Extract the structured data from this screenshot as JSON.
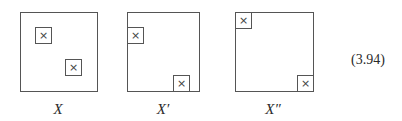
{
  "diagram": {
    "equation_number": "(3.94)",
    "marker_glyph": "×",
    "panels": [
      {
        "label": "X",
        "outer": {
          "x": 20,
          "y": 12,
          "w": 78,
          "h": 80
        },
        "boxes": [
          {
            "x": 35,
            "y": 27
          },
          {
            "x": 65,
            "y": 59
          }
        ],
        "label_pos": {
          "x": 58,
          "y": 102
        }
      },
      {
        "label": "X′",
        "outer": {
          "x": 127,
          "y": 12,
          "w": 73,
          "h": 80
        },
        "boxes": [
          {
            "x": 127,
            "y": 27
          },
          {
            "x": 173,
            "y": 75
          }
        ],
        "label_pos": {
          "x": 163,
          "y": 102
        }
      },
      {
        "label": "X″",
        "outer": {
          "x": 235,
          "y": 12,
          "w": 79,
          "h": 80
        },
        "boxes": [
          {
            "x": 235,
            "y": 12
          },
          {
            "x": 297,
            "y": 75
          }
        ],
        "label_pos": {
          "x": 273,
          "y": 102
        }
      }
    ]
  }
}
